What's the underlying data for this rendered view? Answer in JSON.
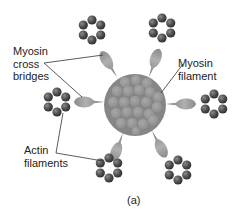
{
  "figure": {
    "caption": "(a)",
    "labels": {
      "cross_bridges": [
        "Myosin",
        "cross",
        "bridges"
      ],
      "myosin_filament": [
        "Myosin",
        "filament"
      ],
      "actin_filaments": [
        "Actin",
        "filaments"
      ]
    }
  },
  "geometry": {
    "myosin_filament": {
      "cx": 135,
      "cy": 105,
      "r": 31
    },
    "actin_rings": [
      {
        "name": "top-left",
        "cx": 92,
        "cy": 30
      },
      {
        "name": "top-right",
        "cx": 162,
        "cy": 28
      },
      {
        "name": "left",
        "cx": 57,
        "cy": 102
      },
      {
        "name": "right",
        "cx": 214,
        "cy": 104
      },
      {
        "name": "bottom-left",
        "cx": 109,
        "cy": 168
      },
      {
        "name": "bottom-right",
        "cx": 178,
        "cy": 170
      }
    ]
  },
  "colors": {
    "filament_fill": "#8a8a8a",
    "filament_bead": "#9a9a9a",
    "actin_bead": "#4a4a4a",
    "cross_bridge": "#9c9c9c",
    "leader_line": "#333333",
    "text": "#222222"
  }
}
